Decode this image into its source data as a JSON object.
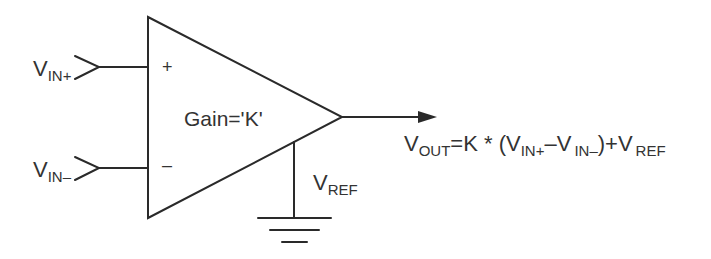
{
  "diagram": {
    "type": "instrumentation-amplifier-schematic",
    "colors": {
      "line": "#2a2a2a",
      "text": "#333333",
      "background": "#ffffff"
    },
    "amplifier": {
      "shape": "triangle",
      "gain_label": "Gain='K'",
      "plus_sign": "+",
      "minus_sign": "–"
    },
    "inputs": [
      {
        "id": "vin_plus",
        "main": "V",
        "sub": "IN+"
      },
      {
        "id": "vin_minus",
        "main": "V",
        "sub": "IN–"
      }
    ],
    "reference": {
      "main": "V",
      "sub": "REF",
      "connection": "ground"
    },
    "output": {
      "equation": {
        "vout_main": "V",
        "vout_sub": "OUT",
        "eq": "=K * (",
        "t1_main": "V",
        "t1_sub": "IN+",
        "minus": "–",
        "t2_main": "V",
        "t2_sub": "IN–",
        "close_plus": ")+",
        "t3_main": "V",
        "t3_sub": "REF"
      }
    }
  }
}
